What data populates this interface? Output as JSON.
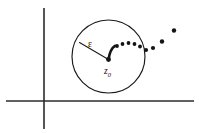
{
  "figure": {
    "background_color": "#ffffff",
    "ink_color": "#141414",
    "axis_color": "#2b2b2b",
    "width": 199,
    "height": 133
  },
  "labels": {
    "epsilon": "ε",
    "center_point": "z",
    "center_subscript": "0"
  },
  "axes": {
    "vertical": {
      "x": 44,
      "y_top": 8,
      "y_bottom": 129
    },
    "horizontal": {
      "y": 101,
      "x_left": 6,
      "x_right": 194
    },
    "origin": {
      "x": 44,
      "y": 101
    }
  },
  "circle": {
    "center_x": 108.5,
    "center_y": 56.5,
    "radius": 36.5,
    "stroke_color": "#1a1a1a"
  },
  "radius_indicator": {
    "from_x": 108.5,
    "from_y": 59.5,
    "to_x": 79.5,
    "to_y": 42.5,
    "label": "ε",
    "label_x": 88,
    "label_y": 47
  },
  "center_marker": {
    "x": 108.5,
    "y": 59.5,
    "label_x": 104,
    "label_y": 74
  },
  "chart_data": {
    "type": "scatter",
    "xlabel": "",
    "ylabel": "",
    "series": [
      {
        "name": "sequence-points",
        "points": [
          {
            "x": 117,
            "y": 46,
            "r": 1.9
          },
          {
            "x": 122.5,
            "y": 44,
            "r": 1.9
          },
          {
            "x": 128.5,
            "y": 43,
            "r": 1.9
          },
          {
            "x": 134.5,
            "y": 44,
            "r": 1.9
          },
          {
            "x": 140,
            "y": 46.5,
            "r": 1.9
          },
          {
            "x": 146,
            "y": 50,
            "r": 2.1
          },
          {
            "x": 153,
            "y": 48,
            "r": 2.1
          },
          {
            "x": 162,
            "y": 41.5,
            "r": 2.2
          },
          {
            "x": 174,
            "y": 30.5,
            "r": 2.2
          }
        ]
      }
    ],
    "tail_path": "M 108.5,59.5 C 109.5,52.5 111.5,48 115,45.8",
    "legend": [],
    "grid": false
  }
}
